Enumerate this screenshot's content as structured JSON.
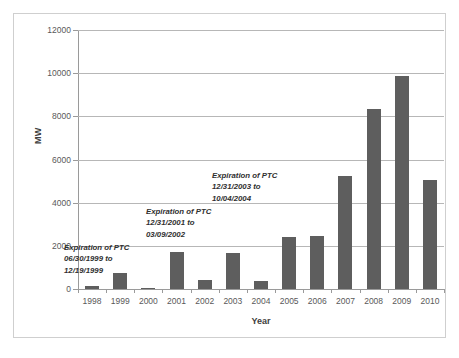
{
  "chart_data": {
    "type": "bar",
    "title": "",
    "xlabel": "Year",
    "ylabel": "MW",
    "categories": [
      "1998",
      "1999",
      "2000",
      "2001",
      "2002",
      "2003",
      "2004",
      "2005",
      "2006",
      "2007",
      "2008",
      "2009",
      "2010"
    ],
    "values": [
      140,
      730,
      50,
      1700,
      410,
      1670,
      370,
      2430,
      2450,
      5220,
      8360,
      9880,
      5060
    ],
    "ylim": [
      0,
      12000
    ],
    "yticks": [
      "0",
      "2000",
      "4000",
      "6000",
      "8000",
      "10000",
      "12000"
    ],
    "ytick_values": [
      0,
      2000,
      4000,
      6000,
      8000,
      10000,
      12000
    ],
    "grid": true,
    "legend": "none",
    "bar_color": "#5e5e5e",
    "grid_color": "#b7b7b7",
    "axis_color": "#9a9a9a",
    "annotations": [
      {
        "id": "ptc-1999",
        "line1": "Expiration of PTC",
        "line2": "06/30/1999 to",
        "line3": "12/19/1999"
      },
      {
        "id": "ptc-2002",
        "line1": "Expiration of PTC",
        "line2": "12/31/2001 to",
        "line3": "03/09/2002"
      },
      {
        "id": "ptc-2004",
        "line1": "Expiration of PTC",
        "line2": "12/31/2003 to",
        "line3": "10/04/2004"
      }
    ]
  }
}
